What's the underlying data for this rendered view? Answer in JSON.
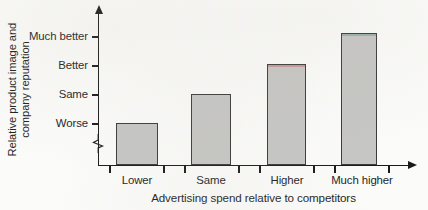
{
  "chart_data": {
    "type": "bar",
    "title": "",
    "subtitle": "",
    "xlabel": "Advertising spend relative to competitors",
    "ylabel_line1": "Relative product image and",
    "ylabel_line2": "company reputation",
    "ylabel": "Relative product image and company reputation",
    "categories": [
      "Lower",
      "Same",
      "Higher",
      "Much higher"
    ],
    "ytick_labels": [
      "Much better",
      "Better",
      "Same",
      "Worse"
    ],
    "values": [
      "Worse",
      "Same",
      "Better",
      "Much better"
    ],
    "value_levels": [
      1,
      2,
      3,
      4
    ],
    "ylim": [
      0,
      4
    ],
    "grid": false,
    "legend": "none",
    "axis_break": true,
    "bar_fill_color": "#c6c6c4",
    "bar_edge_color": "#3a3a3a",
    "axis_color": "#1a1a1a",
    "background_color": "#fbfbf9",
    "bars": [
      {
        "category": "Lower",
        "level_label": "Worse",
        "level": 1,
        "left": 116,
        "width": 42,
        "top": 123,
        "top_tint": "rgba(120,120,120,0.0)"
      },
      {
        "category": "Same",
        "level_label": "Same",
        "level": 2,
        "left": 191,
        "width": 40,
        "top": 94,
        "top_tint": "rgba(120,120,120,0.0)"
      },
      {
        "category": "Higher",
        "level_label": "Better",
        "level": 3,
        "left": 267,
        "width": 39,
        "top": 64,
        "top_tint": "rgba(196,96,96,0.45)"
      },
      {
        "category": "Much higher",
        "level_label": "Much better",
        "level": 4,
        "left": 341,
        "width": 36,
        "top": 33,
        "top_tint": "rgba(96,150,140,0.45)"
      }
    ],
    "ytick_positions": [
      37,
      66,
      95,
      124
    ],
    "xtick_positions": [
      110,
      164,
      185,
      239,
      260,
      314,
      335,
      389
    ],
    "xlabel_positions": [
      137,
      211,
      287,
      362
    ],
    "baseline_y": 165
  }
}
